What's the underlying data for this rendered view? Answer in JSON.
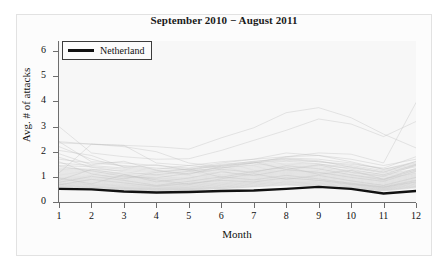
{
  "figure": {
    "background_color": "#ffffff",
    "panel_background_color": "#f7f7f7",
    "frame_color": "#e2e2e2"
  },
  "legend": {
    "position": "top-left-inside",
    "entries": [
      {
        "label": "Netherland",
        "color": "#111111",
        "swatch": "line-swatch"
      }
    ]
  },
  "chart_data": {
    "type": "line",
    "title": "September 2010 − August 2011",
    "xlabel": "Month",
    "ylabel": "Avg. # of attacks",
    "xlim": [
      1,
      12
    ],
    "ylim": [
      0,
      6.4
    ],
    "xticks": [
      1,
      2,
      3,
      4,
      5,
      6,
      7,
      8,
      9,
      10,
      11,
      12
    ],
    "xtick_labels": [
      "1",
      "2",
      "3",
      "4",
      "5",
      "6",
      "7",
      "8",
      "9",
      "10",
      "11",
      "12"
    ],
    "yticks": [
      0,
      1,
      2,
      3,
      4,
      5,
      6
    ],
    "ytick_labels": [
      "0",
      "1",
      "2",
      "3",
      "4",
      "5",
      "6"
    ],
    "grid": false,
    "x": [
      1,
      2,
      3,
      4,
      5,
      6,
      7,
      8,
      9,
      10,
      11,
      12
    ],
    "highlight_series": "Netherland",
    "background_series_color": "#bfbfbf",
    "highlight_series_color": "#111111",
    "series": [
      {
        "name": "Netherland",
        "highlight": true,
        "color": "#111111",
        "width": 2.4,
        "values": [
          0.52,
          0.5,
          0.42,
          0.38,
          0.4,
          0.44,
          0.46,
          0.52,
          0.6,
          0.52,
          0.34,
          0.44
        ]
      },
      {
        "name": "country-01",
        "highlight": false,
        "values": [
          3.0,
          1.95,
          1.8,
          1.7,
          1.72,
          2.05,
          2.45,
          2.85,
          3.3,
          3.1,
          2.6,
          3.2
        ]
      },
      {
        "name": "country-02",
        "highlight": false,
        "values": [
          2.4,
          2.3,
          2.25,
          2.2,
          2.1,
          2.55,
          2.95,
          3.55,
          3.75,
          3.35,
          2.7,
          2.15
        ]
      },
      {
        "name": "country-03",
        "highlight": false,
        "values": [
          1.15,
          2.3,
          2.25,
          1.55,
          1.45,
          1.35,
          1.55,
          1.8,
          1.95,
          1.9,
          1.55,
          3.95
        ]
      },
      {
        "name": "country-04",
        "highlight": false,
        "values": [
          2.35,
          2.3,
          2.2,
          2.0,
          1.55,
          1.4,
          1.55,
          1.65,
          1.6,
          1.5,
          1.35,
          1.8
        ]
      },
      {
        "name": "country-05",
        "highlight": false,
        "values": [
          2.4,
          1.6,
          1.55,
          1.45,
          1.35,
          1.55,
          1.7,
          1.8,
          1.85,
          1.7,
          1.45,
          1.7
        ]
      },
      {
        "name": "country-06",
        "highlight": false,
        "values": [
          2.2,
          1.7,
          1.4,
          1.3,
          1.45,
          1.6,
          1.7,
          1.95,
          1.85,
          1.6,
          1.3,
          1.6
        ]
      },
      {
        "name": "country-07",
        "highlight": false,
        "values": [
          1.7,
          1.55,
          1.45,
          1.35,
          1.3,
          1.5,
          1.6,
          1.75,
          1.7,
          1.55,
          1.3,
          1.55
        ]
      },
      {
        "name": "country-08",
        "highlight": false,
        "values": [
          1.55,
          1.45,
          1.35,
          1.25,
          1.3,
          1.45,
          1.55,
          1.7,
          1.6,
          1.45,
          1.25,
          1.5
        ]
      },
      {
        "name": "country-09",
        "highlight": false,
        "values": [
          1.45,
          1.4,
          1.3,
          1.2,
          1.25,
          1.35,
          1.45,
          1.55,
          1.5,
          1.4,
          1.2,
          1.45
        ]
      },
      {
        "name": "country-10",
        "highlight": false,
        "values": [
          1.35,
          1.3,
          1.25,
          1.15,
          1.2,
          1.3,
          1.4,
          1.5,
          1.45,
          1.35,
          1.15,
          1.4
        ]
      },
      {
        "name": "country-11",
        "highlight": false,
        "values": [
          1.3,
          1.25,
          1.15,
          1.1,
          1.15,
          1.25,
          1.35,
          1.45,
          1.4,
          1.25,
          1.1,
          1.3
        ]
      },
      {
        "name": "country-12",
        "highlight": false,
        "values": [
          1.25,
          1.2,
          1.1,
          1.05,
          1.1,
          1.2,
          1.3,
          1.4,
          1.35,
          1.2,
          1.05,
          1.25
        ]
      },
      {
        "name": "country-13",
        "highlight": false,
        "values": [
          1.2,
          1.15,
          1.05,
          1.0,
          1.05,
          1.15,
          1.25,
          1.35,
          1.3,
          1.15,
          1.0,
          1.2
        ]
      },
      {
        "name": "country-14",
        "highlight": false,
        "values": [
          1.15,
          1.1,
          1.0,
          0.95,
          1.0,
          1.1,
          1.2,
          1.3,
          1.25,
          1.1,
          0.95,
          1.15
        ]
      },
      {
        "name": "country-15",
        "highlight": false,
        "values": [
          1.1,
          1.05,
          0.98,
          0.92,
          0.96,
          1.06,
          1.16,
          1.26,
          1.2,
          1.06,
          0.92,
          1.12
        ]
      },
      {
        "name": "country-16",
        "highlight": false,
        "values": [
          1.05,
          1.0,
          0.94,
          0.88,
          0.92,
          1.02,
          1.12,
          1.22,
          1.16,
          1.02,
          0.88,
          1.08
        ]
      },
      {
        "name": "country-17",
        "highlight": false,
        "values": [
          1.0,
          0.96,
          0.9,
          0.84,
          0.88,
          0.98,
          1.08,
          1.18,
          1.12,
          0.98,
          0.84,
          1.04
        ]
      },
      {
        "name": "country-18",
        "highlight": false,
        "values": [
          0.96,
          0.92,
          0.86,
          0.8,
          0.84,
          0.94,
          1.04,
          1.14,
          1.08,
          0.94,
          0.8,
          1.0
        ]
      },
      {
        "name": "country-19",
        "highlight": false,
        "values": [
          0.92,
          0.88,
          0.82,
          0.76,
          0.8,
          0.9,
          1.0,
          1.1,
          1.04,
          0.9,
          0.76,
          0.96
        ]
      },
      {
        "name": "country-20",
        "highlight": false,
        "values": [
          0.88,
          0.84,
          0.78,
          0.72,
          0.76,
          0.86,
          0.96,
          1.06,
          1.0,
          0.86,
          0.72,
          0.92
        ]
      },
      {
        "name": "country-21",
        "highlight": false,
        "values": [
          0.84,
          0.8,
          0.74,
          0.68,
          0.72,
          0.82,
          0.92,
          1.02,
          0.96,
          0.82,
          0.68,
          0.88
        ]
      },
      {
        "name": "country-22",
        "highlight": false,
        "values": [
          0.8,
          0.76,
          0.7,
          0.65,
          0.69,
          0.78,
          0.88,
          0.98,
          0.92,
          0.78,
          0.65,
          0.84
        ]
      },
      {
        "name": "country-23",
        "highlight": false,
        "values": [
          0.76,
          0.72,
          0.67,
          0.62,
          0.66,
          0.75,
          0.84,
          0.94,
          0.88,
          0.75,
          0.62,
          0.8
        ]
      },
      {
        "name": "country-24",
        "highlight": false,
        "values": [
          0.73,
          0.69,
          0.64,
          0.59,
          0.63,
          0.72,
          0.8,
          0.9,
          0.85,
          0.72,
          0.59,
          0.77
        ]
      },
      {
        "name": "country-25",
        "highlight": false,
        "values": [
          0.7,
          0.66,
          0.61,
          0.56,
          0.6,
          0.69,
          0.77,
          0.86,
          0.81,
          0.69,
          0.56,
          0.74
        ]
      },
      {
        "name": "country-26",
        "highlight": false,
        "values": [
          0.67,
          0.63,
          0.58,
          0.54,
          0.58,
          0.66,
          0.74,
          0.82,
          0.78,
          0.66,
          0.54,
          0.71
        ]
      },
      {
        "name": "country-27",
        "highlight": false,
        "values": [
          0.64,
          0.6,
          0.56,
          0.52,
          0.55,
          0.63,
          0.71,
          0.79,
          0.75,
          0.63,
          0.52,
          0.68
        ]
      },
      {
        "name": "country-28",
        "highlight": false,
        "values": [
          0.61,
          0.58,
          0.54,
          0.5,
          0.53,
          0.6,
          0.68,
          0.76,
          0.72,
          0.6,
          0.5,
          0.65
        ]
      },
      {
        "name": "country-29",
        "highlight": false,
        "values": [
          0.59,
          0.56,
          0.52,
          0.48,
          0.51,
          0.58,
          0.65,
          0.73,
          0.69,
          0.58,
          0.48,
          0.62
        ]
      },
      {
        "name": "country-30",
        "highlight": false,
        "values": [
          0.56,
          0.53,
          0.49,
          0.46,
          0.49,
          0.55,
          0.62,
          0.7,
          0.66,
          0.55,
          0.46,
          0.6
        ]
      },
      {
        "name": "country-31",
        "highlight": false,
        "values": [
          0.54,
          0.51,
          0.47,
          0.44,
          0.47,
          0.53,
          0.6,
          0.67,
          0.63,
          0.53,
          0.44,
          0.57
        ]
      },
      {
        "name": "country-32",
        "highlight": false,
        "values": [
          0.86,
          1.3,
          1.1,
          0.8,
          0.95,
          1.2,
          1.05,
          1.28,
          1.18,
          0.98,
          0.82,
          1.22
        ]
      },
      {
        "name": "country-33",
        "highlight": false,
        "values": [
          1.6,
          1.12,
          0.92,
          1.18,
          1.32,
          0.98,
          1.22,
          1.38,
          1.1,
          1.26,
          0.9,
          1.34
        ]
      },
      {
        "name": "country-34",
        "highlight": false,
        "values": [
          1.92,
          1.48,
          1.62,
          1.26,
          1.1,
          1.42,
          1.58,
          1.3,
          1.48,
          1.18,
          1.02,
          1.46
        ]
      },
      {
        "name": "country-35",
        "highlight": false,
        "values": [
          0.95,
          0.72,
          1.08,
          0.88,
          0.7,
          0.92,
          1.12,
          0.9,
          1.06,
          0.84,
          0.66,
          0.98
        ]
      },
      {
        "name": "country-36",
        "highlight": false,
        "values": [
          0.78,
          1.02,
          0.86,
          0.66,
          0.82,
          1.0,
          0.88,
          1.06,
          0.92,
          0.74,
          0.6,
          0.86
        ]
      },
      {
        "name": "country-37",
        "highlight": false,
        "values": [
          1.42,
          1.24,
          1.02,
          0.96,
          1.14,
          1.3,
          1.18,
          1.44,
          1.32,
          1.08,
          0.88,
          1.28
        ]
      },
      {
        "name": "country-38",
        "highlight": false,
        "values": [
          0.68,
          0.9,
          0.76,
          0.62,
          0.74,
          0.86,
          0.8,
          0.96,
          0.86,
          0.7,
          0.58,
          0.8
        ]
      },
      {
        "name": "country-39",
        "highlight": false,
        "values": [
          2.05,
          1.85,
          1.38,
          1.48,
          1.26,
          1.46,
          1.62,
          1.72,
          1.64,
          1.38,
          1.18,
          1.62
        ]
      },
      {
        "name": "country-40",
        "highlight": false,
        "values": [
          1.78,
          1.38,
          1.2,
          1.08,
          1.22,
          1.36,
          1.48,
          1.62,
          1.52,
          1.3,
          1.08,
          1.5
        ]
      }
    ]
  }
}
